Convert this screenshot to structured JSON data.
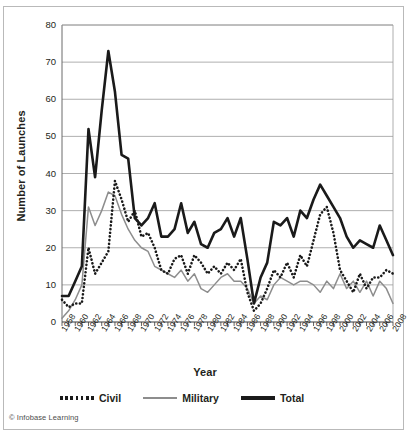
{
  "credit": "© Infobase Learning",
  "legend": {
    "items": [
      {
        "label": "Civil",
        "style": "dotted",
        "color": "#1a1a1a"
      },
      {
        "label": "Military",
        "style": "solid",
        "color": "#8d8d8d"
      },
      {
        "label": "Total",
        "style": "solid-thick",
        "color": "#1a1a1a"
      }
    ]
  },
  "chart_data": {
    "type": "line",
    "title": "",
    "xlabel": "Year",
    "ylabel": "Number of Launches",
    "xlim": [
      1958,
      2008
    ],
    "ylim": [
      0,
      80
    ],
    "yticks": [
      0,
      10,
      20,
      30,
      40,
      50,
      60,
      70,
      80
    ],
    "xticks": [
      1958,
      1960,
      1962,
      1964,
      1966,
      1968,
      1970,
      1972,
      1974,
      1976,
      1978,
      1980,
      1982,
      1984,
      1986,
      1988,
      1990,
      1992,
      1994,
      1996,
      1998,
      2000,
      2002,
      2004,
      2006,
      2008
    ],
    "grid": "horizontal",
    "legend_position": "bottom",
    "x": [
      1958,
      1959,
      1960,
      1961,
      1962,
      1963,
      1964,
      1965,
      1966,
      1967,
      1968,
      1969,
      1970,
      1971,
      1972,
      1973,
      1974,
      1975,
      1976,
      1977,
      1978,
      1979,
      1980,
      1981,
      1982,
      1983,
      1984,
      1985,
      1986,
      1987,
      1988,
      1989,
      1990,
      1991,
      1992,
      1993,
      1994,
      1995,
      1996,
      1997,
      1998,
      1999,
      2000,
      2001,
      2002,
      2003,
      2004,
      2005,
      2006,
      2007,
      2008
    ],
    "series": [
      {
        "name": "Civil",
        "color": "#1a1a1a",
        "style": "dotted",
        "values": [
          6,
          4,
          5,
          5,
          20,
          13,
          16,
          19,
          38,
          33,
          27,
          30,
          23,
          24,
          20,
          14,
          13,
          17,
          18,
          13,
          18,
          16,
          13,
          15,
          13,
          16,
          14,
          17,
          8,
          3,
          5,
          9,
          14,
          12,
          16,
          12,
          18,
          15,
          22,
          29,
          31,
          24,
          14,
          11,
          8,
          13,
          9,
          12,
          12,
          14,
          13
        ]
      },
      {
        "name": "Military",
        "color": "#8d8d8d",
        "style": "solid",
        "values": [
          1,
          3,
          6,
          10,
          31,
          26,
          30,
          35,
          34,
          29,
          25,
          22,
          20,
          19,
          15,
          14,
          13,
          12,
          14,
          11,
          13,
          9,
          8,
          10,
          12,
          13,
          11,
          11,
          9,
          5,
          7,
          6,
          10,
          12,
          11,
          10,
          11,
          11,
          10,
          8,
          11,
          9,
          13,
          9,
          11,
          8,
          11,
          7,
          11,
          9,
          5
        ]
      },
      {
        "name": "Total",
        "color": "#1a1a1a",
        "style": "solid-thick",
        "values": [
          7,
          7,
          11,
          15,
          52,
          39,
          57,
          73,
          62,
          45,
          44,
          28,
          26,
          28,
          32,
          23,
          23,
          25,
          32,
          24,
          27,
          21,
          20,
          24,
          25,
          28,
          23,
          28,
          17,
          5,
          12,
          16,
          27,
          26,
          28,
          23,
          30,
          28,
          33,
          37,
          34,
          31,
          28,
          23,
          20,
          22,
          21,
          20,
          26,
          22,
          18
        ]
      }
    ]
  }
}
